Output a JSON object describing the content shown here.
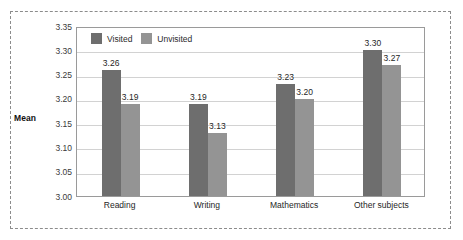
{
  "chart_data": {
    "type": "bar",
    "title": "",
    "xlabel": "",
    "ylabel": "Mean",
    "ylim": [
      3.0,
      3.35
    ],
    "ytick_step": 0.05,
    "ytick_labels": [
      "3.35",
      "3.30",
      "3.25",
      "3.20",
      "3.15",
      "3.10",
      "3.05",
      "3.00"
    ],
    "ytick_values": [
      3.35,
      3.3,
      3.25,
      3.2,
      3.15,
      3.1,
      3.05,
      3.0
    ],
    "grid": true,
    "legend_position": "top-left-inside",
    "categories": [
      "Reading",
      "Writing",
      "Mathematics",
      "Other subjects"
    ],
    "series": [
      {
        "name": "Visited",
        "color": "#6e6e6e",
        "values": [
          3.26,
          3.19,
          3.23,
          3.3
        ],
        "labels": [
          "3.26",
          "3.19",
          "3.23",
          "3.30"
        ]
      },
      {
        "name": "Unvisited",
        "color": "#949494",
        "values": [
          3.19,
          3.13,
          3.2,
          3.27
        ],
        "labels": [
          "3.19",
          "3.13",
          "3.20",
          "3.27"
        ]
      }
    ]
  },
  "axis": {
    "y_label": "Mean",
    "ticks": [
      "3.35",
      "3.30",
      "3.25",
      "3.20",
      "3.15",
      "3.10",
      "3.05",
      "3.00"
    ]
  },
  "legend": {
    "items": [
      {
        "label": "Visited",
        "color": "#6e6e6e"
      },
      {
        "label": "Unvisited",
        "color": "#949494"
      }
    ]
  },
  "categories": [
    "Reading",
    "Writing",
    "Mathematics",
    "Other subjects"
  ],
  "bars": [
    {
      "category": "Reading",
      "visited": "3.26",
      "unvisited": "3.19"
    },
    {
      "category": "Writing",
      "visited": "3.19",
      "unvisited": "3.13"
    },
    {
      "category": "Mathematics",
      "visited": "3.23",
      "unvisited": "3.20"
    },
    {
      "category": "Other subjects",
      "visited": "3.30",
      "unvisited": "3.27"
    }
  ],
  "colors": {
    "visited": "#6e6e6e",
    "unvisited": "#949494",
    "gridline": "#d2d2d2",
    "plot_border": "#9a9a9a",
    "outer_border": "#8c8c8c",
    "text": "#262626",
    "background": "#ffffff"
  }
}
